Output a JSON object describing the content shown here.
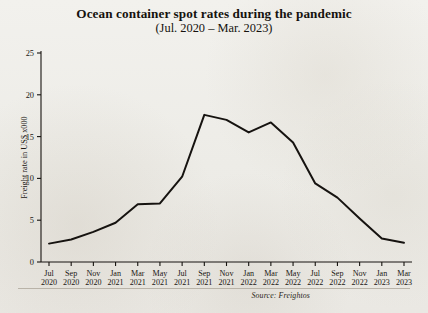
{
  "chart_data": {
    "type": "line",
    "title": "Ocean container spot rates during the pandemic",
    "subtitle": "(Jul. 2020 – Mar. 2023)",
    "xlabel": "",
    "ylabel": "Freight rate in US$ x000",
    "ylim": [
      0,
      25
    ],
    "yticks": [
      0,
      5,
      10,
      15,
      20,
      25
    ],
    "grid": false,
    "legend": "none",
    "source": "Source: Freightos",
    "line_color": "#161310",
    "categories": [
      "Jul 2020",
      "Sep 2020",
      "Nov 2020",
      "Jan 2021",
      "Mar 2021",
      "May 2021",
      "Jul 2021",
      "Sep 2021",
      "Nov 2021",
      "Jan 2022",
      "Mar 2022",
      "May 2022",
      "Jul 2022",
      "Sep 2022",
      "Nov 2022",
      "Jan 2023",
      "Mar 2023"
    ],
    "xtick_months": [
      "Jul",
      "Sep",
      "Nov",
      "Jan",
      "Mar",
      "May",
      "Jul",
      "Sep",
      "Nov",
      "Jan",
      "Mar",
      "May",
      "Jul",
      "Sep",
      "Nov",
      "Jan",
      "Mar"
    ],
    "xtick_years": [
      "2020",
      "2020",
      "2020",
      "2021",
      "2021",
      "2021",
      "2021",
      "2021",
      "2021",
      "2022",
      "2022",
      "2022",
      "2022",
      "2022",
      "2022",
      "2023",
      "2023"
    ],
    "values": [
      2.2,
      2.7,
      3.6,
      4.7,
      6.9,
      7.0,
      10.2,
      17.6,
      17.0,
      15.5,
      16.7,
      14.3,
      9.4,
      7.7,
      5.2,
      2.8,
      2.3
    ]
  },
  "axis": {
    "ytick_labels": [
      "25",
      "20",
      "15",
      "10",
      "5",
      "0"
    ]
  }
}
